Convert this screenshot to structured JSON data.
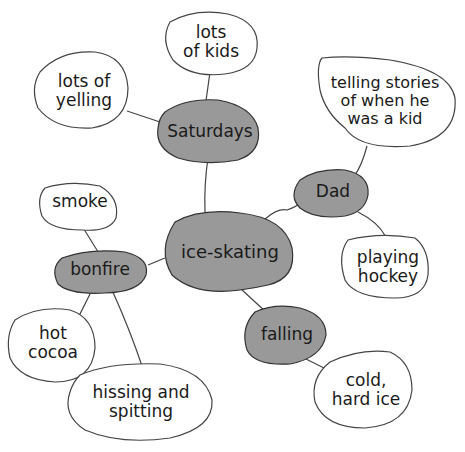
{
  "colors": {
    "main_fill": "#999999",
    "sub_fill": "#999999",
    "leaf_fill": "#ffffff",
    "stroke": "#333333"
  },
  "center": {
    "label": "ice-skating"
  },
  "subtopics": {
    "saturdays": {
      "label": "Saturdays"
    },
    "dad": {
      "label": "Dad"
    },
    "bonfire": {
      "label": "bonfire"
    },
    "falling": {
      "label": "falling"
    }
  },
  "details": {
    "lots_of_kids": {
      "line1": "lots",
      "line2": "of kids"
    },
    "lots_of_yelling": {
      "line1": "lots of",
      "line2": "yelling"
    },
    "telling_stories": {
      "line1": "telling stories",
      "line2": "of when he",
      "line3": "was a kid"
    },
    "playing_hockey": {
      "line1": "playing",
      "line2": "hockey"
    },
    "smoke": {
      "line1": "smoke"
    },
    "hot_cocoa": {
      "line1": "hot",
      "line2": "cocoa"
    },
    "hissing_spitting": {
      "line1": "hissing and",
      "line2": "spitting"
    },
    "cold_hard_ice": {
      "line1": "cold,",
      "line2": "hard ice"
    }
  }
}
